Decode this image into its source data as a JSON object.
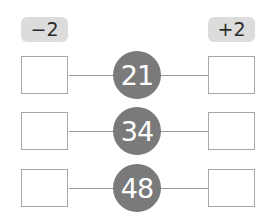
{
  "operations": {
    "left_label": "−2",
    "right_label": "+2"
  },
  "rows": [
    {
      "number": "21",
      "left_value": "",
      "right_value": ""
    },
    {
      "number": "34",
      "left_value": "",
      "right_value": ""
    },
    {
      "number": "48",
      "left_value": "",
      "right_value": ""
    }
  ],
  "colors": {
    "circle": "#7a7a7a",
    "label_bg": "#dcdcdc",
    "line": "#9a9a9a",
    "box_border": "#a8a8a8"
  }
}
